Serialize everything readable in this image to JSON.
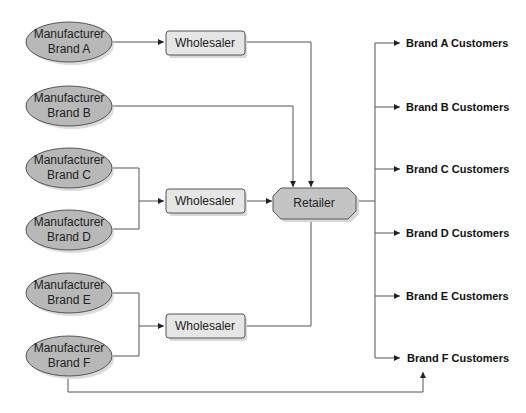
{
  "diagram": {
    "manufacturers": [
      {
        "line1": "Manufacturer",
        "line2": "Brand A"
      },
      {
        "line1": "Manufacturer",
        "line2": "Brand B"
      },
      {
        "line1": "Manufacturer",
        "line2": "Brand C"
      },
      {
        "line1": "Manufacturer",
        "line2": "Brand D"
      },
      {
        "line1": "Manufacturer",
        "line2": "Brand E"
      },
      {
        "line1": "Manufacturer",
        "line2": "Brand F"
      }
    ],
    "wholesalers": [
      {
        "label": "Wholesaler"
      },
      {
        "label": "Wholesaler"
      },
      {
        "label": "Wholesaler"
      }
    ],
    "retailer": {
      "label": "Retailer"
    },
    "customers": [
      {
        "label": "Brand A Customers"
      },
      {
        "label": "Brand B Customers"
      },
      {
        "label": "Brand C Customers"
      },
      {
        "label": "Brand D Customers"
      },
      {
        "label": "Brand E Customers"
      },
      {
        "label": "Brand F Customers"
      }
    ],
    "colors": {
      "ellipse_fill": "#b8b8b8",
      "box_fill": "#e6e6e6",
      "retailer_fill": "#c4c4c4",
      "stroke": "#555555",
      "shadow": "#d8d8d8"
    }
  }
}
